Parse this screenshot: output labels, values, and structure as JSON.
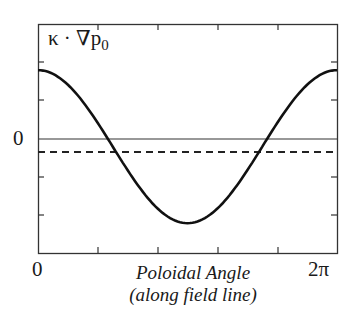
{
  "chart_data": {
    "type": "line",
    "title": "",
    "ylabel": "κ · ∇p₀",
    "ylabel_parts": {
      "main": "κ · ∇p",
      "sub": "0"
    },
    "xlabel": "Poloidal Angle (along field line)",
    "xlabel_lines": [
      "Poloidal Angle",
      "(along field line)"
    ],
    "x_tick_labels": [
      "0",
      "2π"
    ],
    "y_tick_labels": [
      "0"
    ],
    "xlim": [
      0,
      6.2832
    ],
    "ylim": [
      -1.5,
      1.5
    ],
    "grid": false,
    "legend": null,
    "series": [
      {
        "name": "κ · ∇p₀ (curve)",
        "style": "solid",
        "x": [
          0,
          0.785,
          1.571,
          2.356,
          3.1416,
          3.927,
          4.712,
          5.498,
          6.2832
        ],
        "values": [
          0.9,
          0.52,
          -0.1,
          -0.72,
          -1.1,
          -0.72,
          -0.1,
          0.52,
          0.9
        ]
      },
      {
        "name": "zero line",
        "style": "solid-thin",
        "x": [
          0,
          6.2832
        ],
        "values": [
          0,
          0
        ]
      },
      {
        "name": "average (dashed)",
        "style": "dashed",
        "x": [
          0,
          6.2832
        ],
        "values": [
          -0.17,
          -0.17
        ]
      }
    ]
  },
  "labels": {
    "ylabel_main": "κ · ∇p",
    "ylabel_sub": "0",
    "y_zero": "0",
    "x_start": "0",
    "x_end": "2π",
    "xlabel_line1": "Poloidal Angle",
    "xlabel_line2": "(along field line)"
  }
}
